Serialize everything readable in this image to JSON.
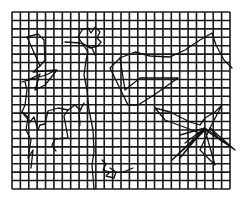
{
  "figure": {
    "background": "#ffffff",
    "stroke_color": "#111111",
    "grid": {
      "x0": 12,
      "y0": 12,
      "x1": 230,
      "y1": 189,
      "cols": 26,
      "rows": 21,
      "line_width": 1.6,
      "color": "#1a1a1a"
    },
    "paths": [
      {
        "name": "left-upper-track",
        "points": [
          [
            38,
            34
          ],
          [
            27,
            37
          ],
          [
            40,
            66
          ],
          [
            45,
            60
          ],
          [
            44,
            40
          ],
          [
            38,
            34
          ]
        ]
      },
      {
        "name": "left-middle-track",
        "points": [
          [
            40,
            66
          ],
          [
            33,
            72
          ],
          [
            56,
            70
          ],
          [
            46,
            75
          ],
          [
            22,
            82
          ],
          [
            28,
            80
          ],
          [
            40,
            74
          ],
          [
            35,
            90
          ],
          [
            45,
            85
          ],
          [
            57,
            70
          ]
        ]
      },
      {
        "name": "left-descent",
        "points": [
          [
            25,
            82
          ],
          [
            27,
            90
          ],
          [
            25,
            105
          ],
          [
            22,
            112
          ],
          [
            28,
            117
          ],
          [
            26,
            130
          ],
          [
            31,
            140
          ],
          [
            28,
            158
          ],
          [
            33,
            150
          ],
          [
            31,
            168
          ]
        ]
      },
      {
        "name": "left-lower-loop",
        "points": [
          [
            22,
            112
          ],
          [
            30,
            122
          ],
          [
            34,
            117
          ],
          [
            38,
            130
          ],
          [
            40,
            125
          ],
          [
            45,
            124
          ],
          [
            48,
            111
          ],
          [
            58,
            108
          ],
          [
            68,
            110
          ],
          [
            64,
            116
          ],
          [
            68,
            138
          ],
          [
            55,
            139
          ],
          [
            52,
            145
          ],
          [
            56,
            151
          ]
        ]
      },
      {
        "name": "left-lower-branch",
        "points": [
          [
            68,
            110
          ],
          [
            75,
            105
          ],
          [
            80,
            110
          ],
          [
            84,
            103
          ],
          [
            79,
            113
          ],
          [
            80,
            125
          ]
        ]
      },
      {
        "name": "center-cluster",
        "points": [
          [
            78,
            37
          ],
          [
            82,
            30
          ],
          [
            88,
            28
          ],
          [
            91,
            33
          ],
          [
            95,
            27
          ],
          [
            100,
            32
          ],
          [
            97,
            38
          ],
          [
            101,
            42
          ],
          [
            98,
            46
          ],
          [
            90,
            48
          ],
          [
            82,
            43
          ],
          [
            78,
            37
          ]
        ]
      },
      {
        "name": "center-stem",
        "points": [
          [
            82,
            43
          ],
          [
            88,
            52
          ],
          [
            86,
            60
          ],
          [
            84,
            75
          ],
          [
            87,
            90
          ],
          [
            89,
            110
          ],
          [
            93,
            130
          ],
          [
            94,
            152
          ],
          [
            92,
            165
          ],
          [
            94,
            189
          ]
        ]
      },
      {
        "name": "center-branch",
        "points": [
          [
            65,
            42
          ],
          [
            80,
            43
          ],
          [
            92,
            48
          ],
          [
            95,
            55
          ]
        ]
      },
      {
        "name": "upper-right-curve",
        "points": [
          [
            120,
            58
          ],
          [
            135,
            52
          ],
          [
            150,
            56
          ],
          [
            170,
            57
          ],
          [
            185,
            50
          ],
          [
            200,
            40
          ],
          [
            212,
            33
          ],
          [
            216,
            45
          ],
          [
            224,
            60
          ],
          [
            232,
            68
          ]
        ]
      },
      {
        "name": "mid-right-box",
        "points": [
          [
            110,
            68
          ],
          [
            120,
            58
          ],
          [
            125,
            90
          ],
          [
            140,
            78
          ],
          [
            178,
            78
          ],
          [
            154,
            95
          ],
          [
            138,
            105
          ],
          [
            128,
            105
          ],
          [
            110,
            68
          ]
        ]
      },
      {
        "name": "right-cluster",
        "points": [
          [
            155,
            108
          ],
          [
            170,
            112
          ],
          [
            190,
            122
          ],
          [
            200,
            125
          ],
          [
            205,
            118
          ],
          [
            215,
            112
          ],
          [
            222,
            105
          ],
          [
            210,
            128
          ],
          [
            220,
            140
          ],
          [
            228,
            145
          ],
          [
            205,
            130
          ],
          [
            195,
            140
          ],
          [
            180,
            158
          ],
          [
            200,
            133
          ],
          [
            165,
            120
          ],
          [
            155,
            108
          ]
        ]
      },
      {
        "name": "right-rays",
        "points": [
          [
            180,
            135
          ],
          [
            205,
            128
          ],
          [
            235,
            150
          ],
          [
            210,
            128
          ],
          [
            200,
            150
          ],
          [
            215,
            165
          ],
          [
            205,
            130
          ],
          [
            172,
            160
          ],
          [
            205,
            128
          ],
          [
            185,
            143
          ]
        ]
      },
      {
        "name": "lower-center-squiggle",
        "points": [
          [
            102,
            160
          ],
          [
            106,
            164
          ],
          [
            103,
            170
          ],
          [
            110,
            172
          ],
          [
            106,
            176
          ],
          [
            114,
            178
          ],
          [
            116,
            172
          ],
          [
            110,
            168
          ]
        ]
      },
      {
        "name": "lower-mid-spur",
        "points": [
          [
            123,
            172
          ],
          [
            133,
            168
          ]
        ]
      }
    ]
  },
  "caption": {
    "text": "·  ·   ·   ·    ·   ·   ·"
  }
}
